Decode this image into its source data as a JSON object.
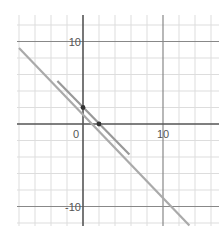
{
  "chart_data": {
    "type": "line",
    "title": "",
    "xlabel": "",
    "ylabel": "",
    "xlim": [
      -8,
      17
    ],
    "ylim": [
      -12.5,
      13
    ],
    "grid": true,
    "grid_step": 2,
    "major_step": 10,
    "tick_labels": {
      "x": [
        {
          "value": 0,
          "label": "0"
        },
        {
          "value": 10,
          "label": "10"
        }
      ],
      "y": [
        {
          "value": 10,
          "label": "10"
        },
        {
          "value": -10,
          "label": "-10"
        }
      ]
    },
    "series": [
      {
        "name": "long-line",
        "kind": "line",
        "equation": "y = -x + 1",
        "x": [
          -8,
          13.3
        ],
        "y": [
          9.2,
          -12.3
        ],
        "color": "#aaaaaa"
      },
      {
        "name": "short-segment",
        "kind": "segment",
        "equation": "y = -x + 2",
        "x": [
          -3.2,
          5.8
        ],
        "y": [
          5.2,
          -3.7
        ],
        "color": "#999999"
      }
    ],
    "points": [
      {
        "x": 0,
        "y": 2,
        "color": "#333333"
      },
      {
        "x": 2,
        "y": 0,
        "color": "#333333"
      }
    ]
  },
  "colors": {
    "grid_minor": "#dddddd",
    "grid_major": "#888888",
    "axis": "#555555",
    "background": "#ffffff"
  }
}
